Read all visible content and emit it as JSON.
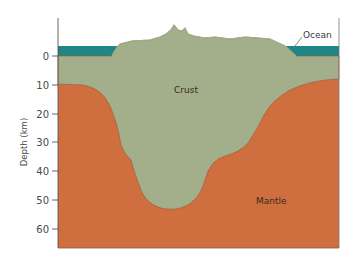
{
  "diagram": {
    "title": "",
    "y_axis": {
      "label": "Depth (km)",
      "ticks": [
        "0",
        "10",
        "20",
        "30",
        "40",
        "50",
        "60"
      ]
    },
    "labels": {
      "ocean": "Ocean",
      "crust": "Crust",
      "mantle": "Mantle"
    },
    "colors": {
      "ocean": "#1f8585",
      "crust": "#a3ae8a",
      "mantle": "#cf6e3f",
      "boundary": "#9a5a34",
      "axis": "#555555"
    }
  }
}
